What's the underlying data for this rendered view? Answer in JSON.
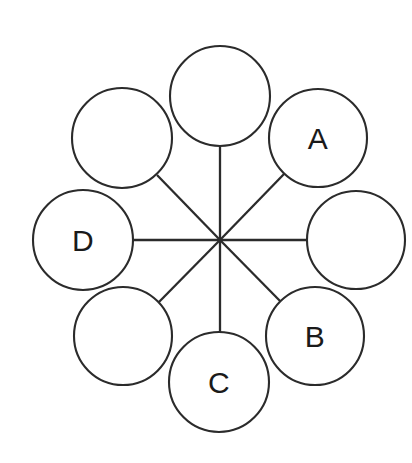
{
  "diagram": {
    "type": "radial-node-graph",
    "canvas": {
      "width": 412,
      "height": 463
    },
    "background_color": "#ffffff",
    "stroke_color": "#2b2b2b",
    "label_color": "#1a1a1a",
    "hub": {
      "id": "hub",
      "cx": 220,
      "cy": 240,
      "label": ""
    },
    "node_count": 8,
    "labeled_node_count": 4,
    "nodes": [
      {
        "id": "node-top",
        "label": "",
        "cx": 220,
        "cy": 96,
        "r": 50,
        "position": "top"
      },
      {
        "id": "node-upper-right",
        "label": "A",
        "cx": 318,
        "cy": 138,
        "r": 49,
        "position": "upper-right"
      },
      {
        "id": "node-right",
        "label": "",
        "cx": 356,
        "cy": 240,
        "r": 49,
        "position": "right"
      },
      {
        "id": "node-lower-right",
        "label": "B",
        "cx": 315,
        "cy": 336,
        "r": 49,
        "position": "lower-right"
      },
      {
        "id": "node-bottom",
        "label": "C",
        "cx": 219,
        "cy": 382,
        "r": 50,
        "position": "bottom"
      },
      {
        "id": "node-lower-left",
        "label": "",
        "cx": 123,
        "cy": 336,
        "r": 49,
        "position": "lower-left"
      },
      {
        "id": "node-left",
        "label": "D",
        "cx": 83,
        "cy": 240,
        "r": 50,
        "position": "left"
      },
      {
        "id": "node-upper-left",
        "label": "",
        "cx": 122,
        "cy": 138,
        "r": 50,
        "position": "upper-left"
      }
    ],
    "spokes": [
      {
        "id": "spoke-top",
        "to": "node-top",
        "x1": 220,
        "y1": 240,
        "x2": 220,
        "y2": 147
      },
      {
        "id": "spoke-upper-right",
        "to": "node-upper-right",
        "x1": 220,
        "y1": 240,
        "x2": 285,
        "y2": 173
      },
      {
        "id": "spoke-right",
        "to": "node-right",
        "x1": 220,
        "y1": 240,
        "x2": 307,
        "y2": 240
      },
      {
        "id": "spoke-lower-right",
        "to": "node-lower-right",
        "x1": 220,
        "y1": 240,
        "x2": 282,
        "y2": 303
      },
      {
        "id": "spoke-bottom",
        "to": "node-bottom",
        "x1": 220,
        "y1": 240,
        "x2": 220,
        "y2": 333
      },
      {
        "id": "spoke-lower-left",
        "to": "node-lower-left",
        "x1": 220,
        "y1": 240,
        "x2": 158,
        "y2": 303
      },
      {
        "id": "spoke-left",
        "to": "node-left",
        "x1": 220,
        "y1": 240,
        "x2": 133,
        "y2": 240
      },
      {
        "id": "spoke-upper-left",
        "to": "node-upper-left",
        "x1": 220,
        "y1": 240,
        "x2": 157,
        "y2": 175
      }
    ],
    "labels": {
      "a": "A",
      "b": "B",
      "c": "C",
      "d": "D"
    }
  }
}
